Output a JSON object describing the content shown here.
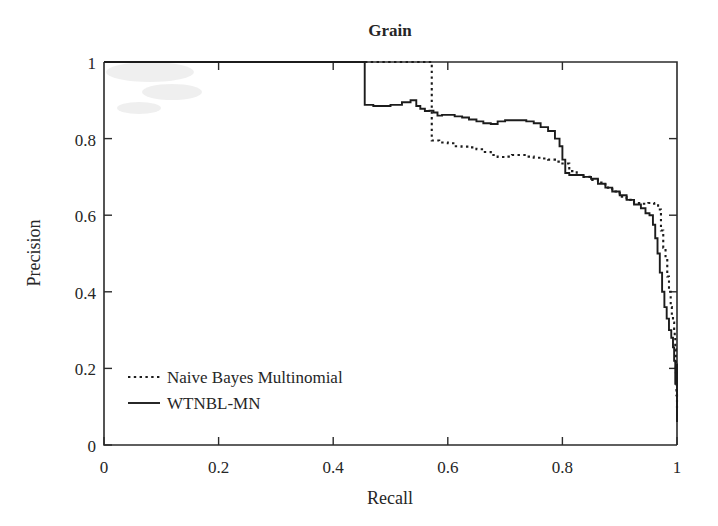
{
  "chart_data": {
    "type": "line",
    "title": "Grain",
    "xlabel": "Recall",
    "ylabel": "Precision",
    "xlim": [
      0,
      1
    ],
    "ylim": [
      0,
      1
    ],
    "grid": false,
    "legend_position": "lower-left-inside",
    "xticks": [
      "0",
      "0.2",
      "0.4",
      "0.6",
      "0.8",
      "1"
    ],
    "xtick_values": [
      0,
      0.2,
      0.4,
      0.6,
      0.8,
      1
    ],
    "yticks": [
      "0",
      "0.2",
      "0.4",
      "0.6",
      "0.8",
      "1"
    ],
    "ytick_values": [
      0,
      0.2,
      0.4,
      0.6,
      0.8,
      1
    ],
    "series": [
      {
        "name": "Naive Bayes Multinomial",
        "style": "dotted",
        "color": "#1c1c1c",
        "x": [
          0.0,
          0.572,
          0.572,
          0.585,
          0.6,
          0.612,
          0.624,
          0.637,
          0.65,
          0.662,
          0.675,
          0.687,
          0.7,
          0.712,
          0.725,
          0.737,
          0.75,
          0.762,
          0.775,
          0.787,
          0.8,
          0.812,
          0.825,
          0.837,
          0.85,
          0.862,
          0.875,
          0.887,
          0.9,
          0.912,
          0.925,
          0.937,
          0.95,
          0.96,
          0.967,
          0.972,
          0.976,
          0.98,
          0.983,
          0.986,
          0.989,
          0.991,
          0.993,
          0.995,
          0.996,
          0.997,
          0.998,
          0.999,
          1.0
        ],
        "y": [
          1.0,
          1.0,
          0.795,
          0.79,
          0.788,
          0.78,
          0.779,
          0.777,
          0.772,
          0.765,
          0.757,
          0.752,
          0.753,
          0.757,
          0.757,
          0.753,
          0.75,
          0.748,
          0.745,
          0.74,
          0.735,
          0.715,
          0.705,
          0.7,
          0.692,
          0.685,
          0.672,
          0.662,
          0.648,
          0.64,
          0.632,
          0.63,
          0.632,
          0.63,
          0.615,
          0.56,
          0.515,
          0.49,
          0.44,
          0.4,
          0.36,
          0.335,
          0.32,
          0.3,
          0.28,
          0.25,
          0.19,
          0.13,
          0.09
        ]
      },
      {
        "name": "WTNBL-MN",
        "style": "solid",
        "color": "#1c1c1c",
        "x": [
          0.0,
          0.455,
          0.455,
          0.47,
          0.5,
          0.52,
          0.535,
          0.545,
          0.552,
          0.56,
          0.568,
          0.575,
          0.582,
          0.59,
          0.6,
          0.612,
          0.625,
          0.637,
          0.65,
          0.662,
          0.675,
          0.687,
          0.7,
          0.712,
          0.725,
          0.737,
          0.75,
          0.762,
          0.775,
          0.787,
          0.795,
          0.8,
          0.805,
          0.812,
          0.825,
          0.837,
          0.85,
          0.862,
          0.875,
          0.887,
          0.9,
          0.912,
          0.925,
          0.937,
          0.945,
          0.952,
          0.958,
          0.962,
          0.966,
          0.97,
          0.974,
          0.978,
          0.982,
          0.986,
          0.99,
          0.993,
          0.995,
          0.997,
          0.999,
          1.0,
          1.0
        ],
        "y": [
          1.0,
          1.0,
          0.888,
          0.885,
          0.888,
          0.895,
          0.9,
          0.885,
          0.878,
          0.872,
          0.873,
          0.868,
          0.86,
          0.862,
          0.862,
          0.858,
          0.855,
          0.85,
          0.845,
          0.84,
          0.838,
          0.845,
          0.848,
          0.848,
          0.848,
          0.845,
          0.84,
          0.83,
          0.82,
          0.8,
          0.78,
          0.745,
          0.71,
          0.705,
          0.705,
          0.7,
          0.695,
          0.682,
          0.672,
          0.662,
          0.652,
          0.64,
          0.628,
          0.618,
          0.605,
          0.6,
          0.575,
          0.54,
          0.5,
          0.45,
          0.4,
          0.36,
          0.33,
          0.3,
          0.28,
          0.255,
          0.22,
          0.16,
          0.21,
          0.21,
          0.06
        ]
      }
    ]
  },
  "legend": {
    "entries": [
      {
        "label": "Naive Bayes Multinomial",
        "style": "dotted"
      },
      {
        "label": "WTNBL-MN",
        "style": "solid"
      }
    ]
  }
}
